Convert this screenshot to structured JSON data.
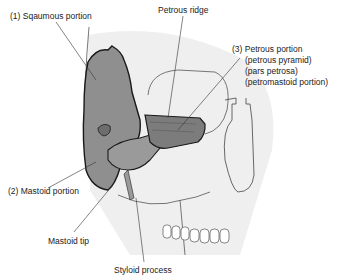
{
  "diagram": {
    "colors": {
      "bone_fill": "#8f8f8f",
      "bone_dark": "#5a5a5a",
      "skull_shade": "#eeeeee",
      "outline": "#222222",
      "leader": "#333333"
    },
    "labels": {
      "squamous": "(1) Sqaumous portion",
      "petrous_ridge": "Petrous ridge",
      "petrous_1": "(3) Petrous portion",
      "petrous_2": "(petrous pyramid)",
      "petrous_3": "(pars petrosa)",
      "petrous_4": "(petromastoid portion)",
      "mastoid": "(2) Mastoid portion",
      "mastoid_tip": "Mastoid tip",
      "styloid": "Styloid process"
    }
  }
}
